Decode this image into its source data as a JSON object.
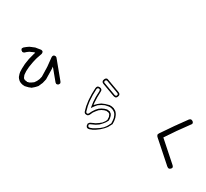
{
  "image": {
    "background": "#ffffff",
    "characters": [
      {
        "char": "ひ",
        "style": "solid",
        "color": "#000000",
        "rotation_deg": -15
      },
      {
        "char": "ら",
        "style": "outline",
        "color": "#000000",
        "fill": "#ffffff",
        "rotation_deg": 20
      },
      {
        "char": "く",
        "style": "solid",
        "color": "#000000",
        "rotation_deg": 10
      }
    ]
  }
}
